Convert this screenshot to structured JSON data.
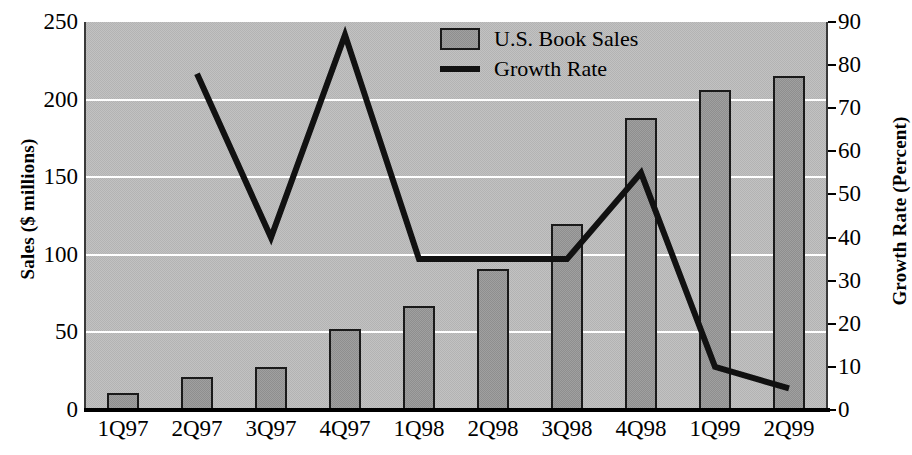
{
  "chart_data": {
    "type": "bar",
    "title": "",
    "categories": [
      "1Q97",
      "2Q97",
      "3Q97",
      "4Q97",
      "1Q98",
      "2Q98",
      "3Q98",
      "4Q98",
      "1Q99",
      "2Q99"
    ],
    "xlabel": "",
    "grid": true,
    "legend_position": "top-center",
    "series": [
      {
        "name": "U.S. Book Sales",
        "type": "bar",
        "axis": "left",
        "unit": "$ millions",
        "color": "#8e8e8e",
        "values": [
          11,
          21,
          28,
          52,
          67,
          91,
          120,
          188,
          206,
          215
        ]
      },
      {
        "name": "Growth Rate",
        "type": "line",
        "axis": "right",
        "unit": "percent",
        "color": "#111111",
        "values": [
          null,
          78,
          40,
          87,
          35,
          35,
          35,
          55,
          10,
          5
        ]
      }
    ],
    "axes": {
      "left": {
        "label": "Sales ($ millions)",
        "ticks": [
          250,
          200,
          150,
          100,
          50,
          0
        ],
        "min": 0,
        "max": 250
      },
      "right": {
        "label": "Growth Rate (Percent)",
        "ticks": [
          90,
          80,
          70,
          60,
          50,
          40,
          30,
          20,
          10,
          0
        ],
        "min": 0,
        "max": 90
      }
    }
  },
  "legend": {
    "items": [
      {
        "label": "U.S. Book Sales",
        "marker": "box-swatch"
      },
      {
        "label": "Growth Rate",
        "marker": "line-swatch"
      }
    ]
  },
  "colors": {
    "plot_background": "#b3b3b3",
    "bar_fill": "#8e8e8e",
    "bar_outline": "#1a1a1a",
    "line": "#111111",
    "gridline": "#ffffff",
    "text": "#000000"
  }
}
